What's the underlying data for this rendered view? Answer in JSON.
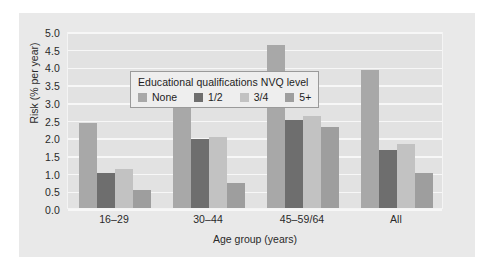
{
  "chart_data": {
    "type": "bar",
    "title": "",
    "subtitle": "",
    "xlabel": "Age group (years)",
    "ylabel": "Risk (% per year)",
    "categories": [
      "16–29",
      "30–44",
      "45–59/64",
      "All"
    ],
    "series": [
      {
        "name": "None",
        "color": "#a8a8a8",
        "values": [
          2.4,
          3.2,
          4.6,
          3.9
        ]
      },
      {
        "name": "1/2",
        "color": "#6e6e6e",
        "values": [
          1.0,
          1.95,
          2.5,
          1.65
        ]
      },
      {
        "name": "3/4",
        "color": "#c2c2c2",
        "values": [
          1.1,
          2.0,
          2.6,
          1.8
        ]
      },
      {
        "name": "5+",
        "color": "#9e9e9e",
        "values": [
          0.5,
          0.7,
          2.3,
          1.0
        ]
      }
    ],
    "ylim": [
      0.0,
      5.0
    ],
    "ytick_step": 0.5,
    "ytick_labels": [
      "0.0",
      "0.5",
      "1.0",
      "1.5",
      "2.0",
      "2.5",
      "3.0",
      "3.5",
      "4.0",
      "4.5",
      "5.0"
    ],
    "grid": true,
    "grid_axis": "y",
    "legend_position": "upper-left-inside",
    "legend_title": "Educational qualifications NVQ level",
    "plot_background": "#e2e2e2",
    "figure_background": "#e9e9e9",
    "gridline_color": "#f7f7f7"
  }
}
